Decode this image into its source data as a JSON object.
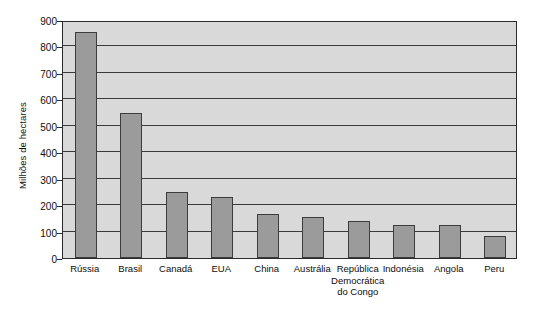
{
  "chart_data": {
    "type": "bar",
    "title": "",
    "subtitle": "",
    "xlabel": "",
    "ylabel": "Milhões de hectares",
    "ylim": [
      0,
      900
    ],
    "ytick_step": 100,
    "yticks": [
      900,
      800,
      700,
      600,
      500,
      400,
      300,
      200,
      100,
      0
    ],
    "grid": true,
    "legend": false,
    "categories": [
      "Rússia",
      "Brasil",
      "Canadá",
      "EUA",
      "China",
      "Austrália",
      "República Democrática do Congo",
      "Indonésia",
      "Angola",
      "Peru"
    ],
    "category_lines": [
      [
        "Rússia"
      ],
      [
        "Brasil"
      ],
      [
        "Canadá"
      ],
      [
        "EUA"
      ],
      [
        "China"
      ],
      [
        "Austrália"
      ],
      [
        "República",
        "Democrática",
        "do Congo"
      ],
      [
        "Indonésia"
      ],
      [
        "Angola"
      ],
      [
        "Peru"
      ]
    ],
    "values": [
      855,
      548,
      250,
      232,
      168,
      155,
      140,
      123,
      124,
      85
    ],
    "colors": {
      "bar_fill": "#9b9b9b",
      "bar_stroke": "#3c3c3c",
      "plot_background": "#d9d9d9",
      "gridline": "#3a3a3a",
      "axis": "#2b2b2b",
      "text": "#0d0d0d",
      "page_background": "#ffffff"
    }
  }
}
